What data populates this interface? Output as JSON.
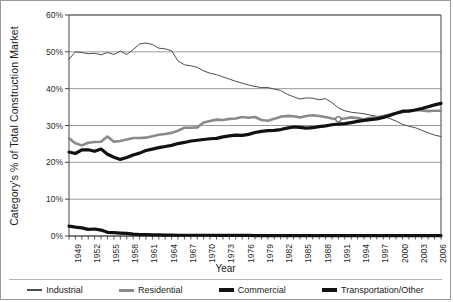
{
  "chart_data": {
    "type": "line",
    "title": "",
    "xlabel": "Year",
    "ylabel": "Category's % of Total Construction Market",
    "ylim": [
      0,
      60
    ],
    "yticks": [
      "0%",
      "10%",
      "20%",
      "30%",
      "40%",
      "50%",
      "60%"
    ],
    "ytick_values": [
      0,
      10,
      20,
      30,
      40,
      50,
      60
    ],
    "grid": true,
    "legend_position": "bottom",
    "x_start": 1949,
    "x_end": 2007,
    "xtick_labels": [
      "1949",
      "1952",
      "1955",
      "1958",
      "1961",
      "1964",
      "1967",
      "1970",
      "1973",
      "1976",
      "1979",
      "1982",
      "1985",
      "1988",
      "1991",
      "1994",
      "1997",
      "2000",
      "2003",
      "2006"
    ],
    "x": [
      1949,
      1950,
      1951,
      1952,
      1953,
      1954,
      1955,
      1956,
      1957,
      1958,
      1959,
      1960,
      1961,
      1962,
      1963,
      1964,
      1965,
      1966,
      1967,
      1968,
      1969,
      1970,
      1971,
      1972,
      1973,
      1974,
      1975,
      1976,
      1977,
      1978,
      1979,
      1980,
      1981,
      1982,
      1983,
      1984,
      1985,
      1986,
      1987,
      1988,
      1989,
      1990,
      1991,
      1992,
      1993,
      1994,
      1995,
      1996,
      1997,
      1998,
      1999,
      2000,
      2001,
      2002,
      2003,
      2004,
      2005,
      2006,
      2007
    ],
    "series": [
      {
        "name": "Industrial",
        "color": "#4d4d4d",
        "width": 1,
        "values": [
          48.0,
          50.0,
          49.8,
          49.5,
          49.6,
          49.2,
          49.8,
          49.3,
          50.2,
          49.3,
          50.6,
          52.1,
          52.4,
          52.0,
          51.0,
          50.8,
          50.3,
          47.5,
          46.5,
          46.2,
          45.8,
          44.8,
          44.2,
          43.8,
          43.2,
          42.6,
          42.0,
          41.5,
          41.0,
          40.6,
          40.3,
          40.3,
          39.9,
          39.5,
          38.5,
          37.8,
          37.2,
          37.5,
          37.4,
          37.0,
          37.3,
          36.2,
          34.8,
          34.0,
          33.6,
          33.4,
          33.2,
          32.8,
          32.5,
          32.4,
          31.9,
          31.2,
          30.3,
          29.8,
          29.4,
          28.7,
          28.0,
          27.4,
          27.0
        ]
      },
      {
        "name": "Residential",
        "color": "#8a8a8a",
        "width": 2.6,
        "values": [
          26.5,
          25.2,
          24.6,
          25.3,
          25.5,
          25.6,
          27.0,
          25.6,
          25.8,
          26.2,
          26.6,
          26.6,
          26.7,
          27.1,
          27.5,
          27.7,
          28.0,
          28.6,
          29.4,
          29.4,
          29.5,
          30.8,
          31.2,
          31.6,
          31.5,
          31.8,
          31.9,
          32.3,
          32.1,
          32.3,
          31.5,
          31.3,
          31.8,
          32.4,
          32.6,
          32.5,
          32.2,
          32.6,
          32.8,
          32.6,
          32.3,
          31.9,
          31.7,
          31.9,
          32.2,
          32.0,
          31.6,
          32.1,
          32.2,
          32.6,
          33.0,
          33.4,
          33.6,
          34.0,
          34.2,
          34.1,
          33.9,
          34.0,
          34.0
        ]
      },
      {
        "name": "Commercial",
        "color": "#111111",
        "width": 3.2,
        "values": [
          22.8,
          22.4,
          23.4,
          23.4,
          23.0,
          23.6,
          22.2,
          21.4,
          20.8,
          21.3,
          22.0,
          22.5,
          23.2,
          23.6,
          24.0,
          24.3,
          24.6,
          25.1,
          25.4,
          25.8,
          26.0,
          26.2,
          26.4,
          26.5,
          26.9,
          27.2,
          27.4,
          27.3,
          27.6,
          28.1,
          28.4,
          28.6,
          28.7,
          28.9,
          29.3,
          29.6,
          29.5,
          29.3,
          29.4,
          29.7,
          29.9,
          30.2,
          30.4,
          30.5,
          30.8,
          31.1,
          31.4,
          31.6,
          31.8,
          32.2,
          32.7,
          33.3,
          33.9,
          33.9,
          34.2,
          34.6,
          35.1,
          35.6,
          36.0
        ]
      },
      {
        "name": "Transportation/Other",
        "color": "#111111",
        "width": 3.2,
        "values": [
          2.7,
          2.4,
          2.2,
          1.8,
          1.9,
          1.6,
          1.0,
          0.9,
          0.8,
          0.7,
          0.5,
          0.4,
          0.35,
          0.3,
          0.3,
          0.25,
          0.25,
          0.2,
          0.2,
          0.2,
          0.2,
          0.2,
          0.2,
          0.15,
          0.15,
          0.15,
          0.15,
          0.15,
          0.15,
          0.1,
          0.1,
          0.1,
          0.1,
          0.1,
          0.1,
          0.1,
          0.1,
          0.1,
          0.1,
          0.1,
          0.1,
          0.1,
          0.1,
          0.1,
          0.1,
          0.1,
          0.1,
          0.1,
          0.1,
          0.1,
          0.1,
          0.1,
          0.1,
          0.1,
          0.1,
          0.1,
          0.1,
          0.1,
          0.1
        ]
      }
    ],
    "marker_annotation": {
      "year": 1991,
      "value": 31.7,
      "series": "Residential"
    }
  },
  "legend": {
    "items": [
      {
        "label": "Industrial",
        "color": "#4d4d4d",
        "thickness": 1.5
      },
      {
        "label": "Residential",
        "color": "#8a8a8a",
        "thickness": 3
      },
      {
        "label": "Commercial",
        "color": "#111111",
        "thickness": 4
      },
      {
        "label": "Transportation/Other",
        "color": "#111111",
        "thickness": 4
      }
    ]
  }
}
